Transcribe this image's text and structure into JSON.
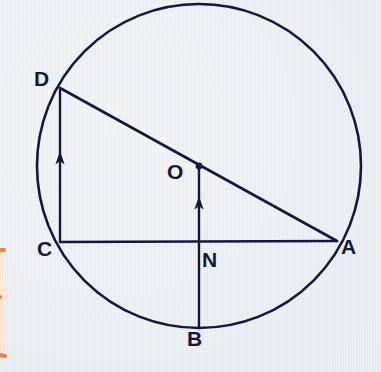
{
  "figure": {
    "background_color": "#e7ecf2",
    "ink_color": "#14183f",
    "doodle_color": "#e0875a",
    "doodle_fill_color": "#fbe7d6",
    "canvas": {
      "width": 381,
      "height": 372
    }
  },
  "circle": {
    "name": "main-circle",
    "center_label": "O",
    "center_x": 199,
    "center_y": 166,
    "radius": 162,
    "stroke_width": 2.6
  },
  "points": [
    {
      "id": "D",
      "label": "D",
      "x": 60,
      "y": 88,
      "on_circle": true
    },
    {
      "id": "C",
      "label": "C",
      "x": 60,
      "y": 242,
      "on_circle": true
    },
    {
      "id": "A",
      "label": "A",
      "x": 337,
      "y": 241,
      "on_circle": true
    },
    {
      "id": "B",
      "label": "B",
      "x": 199,
      "y": 328,
      "on_circle": true
    },
    {
      "id": "O",
      "label": "O",
      "x": 199,
      "y": 166,
      "on_circle": false
    },
    {
      "id": "N",
      "label": "N",
      "x": 199,
      "y": 242,
      "on_circle": false
    }
  ],
  "segments": [
    {
      "id": "DA",
      "from": "D",
      "to": "A",
      "label": "D to A diameter chord",
      "arrow": "none"
    },
    {
      "id": "CD",
      "from": "C",
      "to": "D",
      "label": "C to D chord",
      "arrow": "toward-D"
    },
    {
      "id": "CA",
      "from": "C",
      "to": "A",
      "label": "C to A chord",
      "arrow": "none"
    },
    {
      "id": "BO",
      "from": "B",
      "to": "O",
      "label": "B through N to O",
      "arrow": "toward-O"
    }
  ],
  "labels": {
    "D": "D",
    "C": "C",
    "A": "A",
    "B": "B",
    "O": "O",
    "N": "N"
  }
}
